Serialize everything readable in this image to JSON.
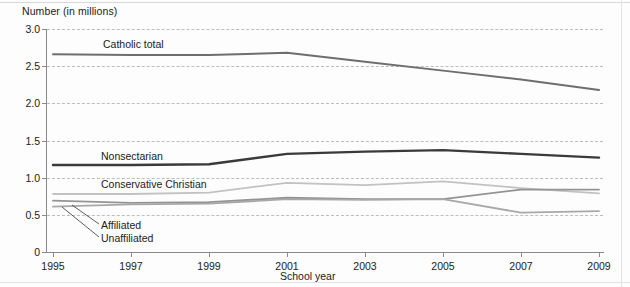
{
  "chart_data": {
    "type": "line",
    "title": "",
    "ylabel": "Number (in millions)",
    "xlabel": "School year",
    "x": [
      1995,
      1997,
      1999,
      2001,
      2003,
      2005,
      2007,
      2009
    ],
    "xlim": [
      1995,
      2009
    ],
    "ylim": [
      0,
      3.0
    ],
    "ytick_labels": [
      "0",
      "0.5",
      "1.0",
      "1.5",
      "2.0",
      "2.5",
      "3.0"
    ],
    "ytick_values": [
      0,
      0.5,
      1.0,
      1.5,
      2.0,
      2.5,
      3.0
    ],
    "xtick_labels": [
      "1995",
      "1997",
      "1999",
      "2001",
      "2003",
      "2005",
      "2007",
      "2009"
    ],
    "grid": "horizontal-dashed",
    "legend": "inline-labels",
    "series": [
      {
        "name": "Catholic total",
        "color": "#6e6e6e",
        "width": 2.0,
        "values": [
          2.66,
          2.65,
          2.65,
          2.68,
          2.56,
          2.44,
          2.32,
          2.18
        ]
      },
      {
        "name": "Nonsectarian",
        "color": "#3a3a3a",
        "width": 2.4,
        "values": [
          1.17,
          1.17,
          1.18,
          1.32,
          1.35,
          1.37,
          1.32,
          1.27
        ]
      },
      {
        "name": "Conservative Christian",
        "color": "#c2c2c2",
        "width": 1.8,
        "values": [
          0.78,
          0.78,
          0.8,
          0.93,
          0.9,
          0.95,
          0.86,
          0.79
        ]
      },
      {
        "name": "Affiliated",
        "color": "#949494",
        "width": 1.8,
        "values": [
          0.69,
          0.66,
          0.67,
          0.73,
          0.71,
          0.71,
          0.84,
          0.84
        ]
      },
      {
        "name": "Unaffiliated",
        "color": "#a8a8a8",
        "width": 1.8,
        "values": [
          0.61,
          0.64,
          0.65,
          0.71,
          0.7,
          0.71,
          0.53,
          0.55
        ]
      }
    ],
    "annotations": [
      {
        "text": "Catholic total",
        "series": "Catholic total"
      },
      {
        "text": "Nonsectarian",
        "series": "Nonsectarian"
      },
      {
        "text": "Conservative Christian",
        "series": "Conservative Christian"
      },
      {
        "text": "Affiliated",
        "series": "Affiliated",
        "leader": true
      },
      {
        "text": "Unaffiliated",
        "series": "Unaffiliated",
        "leader": true
      }
    ]
  }
}
